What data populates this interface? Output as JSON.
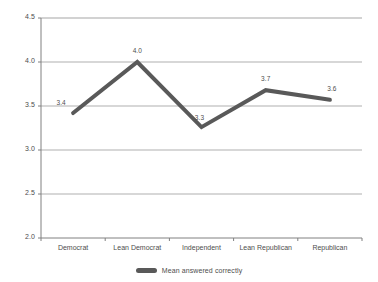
{
  "chart_data": {
    "type": "line",
    "title": "",
    "xlabel": "",
    "ylabel": "",
    "categories": [
      "Democrat",
      "Lean Democrat",
      "Independent",
      "Lean Republican",
      "Republican"
    ],
    "values": [
      3.42,
      4.0,
      3.26,
      3.68,
      3.57
    ],
    "point_labels": [
      "3.4",
      "4.0",
      "3.3",
      "3.7",
      "3.6"
    ],
    "series": [
      {
        "name": "Mean answered correctly",
        "values": [
          3.42,
          4.0,
          3.26,
          3.68,
          3.57
        ],
        "color": "#595959"
      }
    ],
    "ylim": [
      2.0,
      4.5
    ],
    "ytick_labels": [
      "4.5",
      "4.0",
      "3.5",
      "3.0",
      "2.5",
      "2.0"
    ],
    "ytick_values": [
      4.5,
      4.0,
      3.5,
      3.0,
      2.5,
      2.0
    ],
    "grid": true,
    "grid_axis": "y",
    "legend": {
      "position": "bottom",
      "entries": [
        {
          "label": "Mean answered correctly",
          "color": "#595959"
        }
      ]
    },
    "colors": {
      "series": "#595959",
      "grid": "#a6a6a6",
      "axis": "#808080",
      "text": "#4d4d4d",
      "background": "#ffffff"
    }
  }
}
